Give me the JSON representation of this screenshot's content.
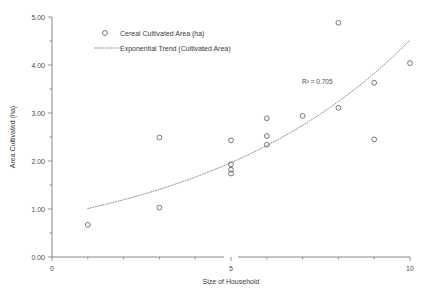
{
  "chart_data": {
    "type": "scatter",
    "title": "",
    "xlabel": "Size of Household",
    "ylabel": "Area Cultivated (ha)",
    "xlim": [
      0,
      10
    ],
    "ylim": [
      0,
      5
    ],
    "grid": false,
    "legend_position": "top-left",
    "x_ticks": [
      0,
      5,
      10
    ],
    "x_tick_labels": [
      "0",
      "5",
      "10"
    ],
    "x_minor_ticks": [
      1,
      2,
      3,
      4,
      6,
      7,
      8,
      9
    ],
    "y_ticks": [
      0,
      1,
      2,
      3,
      4,
      5
    ],
    "y_tick_labels": [
      "0.00",
      "1.00",
      "2.00",
      "3.00",
      "4.00",
      "5.00"
    ],
    "y_minor_ticks": [
      0.5,
      1.5,
      2.5,
      3.5,
      4.5
    ],
    "series": [
      {
        "name": "Cereal Cultivated Area (ha)",
        "marker": "open-circle",
        "points": [
          {
            "x": 1,
            "y": 0.67
          },
          {
            "x": 3,
            "y": 1.03
          },
          {
            "x": 3,
            "y": 2.49
          },
          {
            "x": 5,
            "y": 2.43
          },
          {
            "x": 5,
            "y": 1.93
          },
          {
            "x": 5,
            "y": 1.82
          },
          {
            "x": 5,
            "y": 1.74
          },
          {
            "x": 6,
            "y": 2.89
          },
          {
            "x": 6,
            "y": 2.52
          },
          {
            "x": 6,
            "y": 2.34
          },
          {
            "x": 7,
            "y": 2.94
          },
          {
            "x": 8,
            "y": 4.88
          },
          {
            "x": 8,
            "y": 3.11
          },
          {
            "x": 9,
            "y": 3.63
          },
          {
            "x": 9,
            "y": 2.45
          },
          {
            "x": 10,
            "y": 4.04
          }
        ]
      }
    ],
    "trend": {
      "name": "Exponential Trend (Cultivated Area)",
      "style": "dotted",
      "model": "exponential",
      "x_start": 1.0,
      "x_end": 10.0,
      "y_start": 1.01,
      "y_end": 4.52,
      "r_squared_label": "R² = 0.705",
      "r_squared": 0.705
    }
  },
  "legend": {
    "items": [
      {
        "label": "Cereal Cultivated Area (ha)",
        "marker": "open-circle"
      },
      {
        "label": "Exponential Trend (Cultivated Area)",
        "marker": "dotted-line"
      }
    ]
  },
  "annotation": {
    "r_squared": "R² = 0.705"
  },
  "axes": {
    "x_title": "Size of Household",
    "y_title": "Area Cultivated (ha)"
  },
  "colors": {
    "marker_stroke": "#555555",
    "trend_stroke": "#8a8a8a",
    "axis": "#6b6b6b",
    "text": "#3a3a3a",
    "background": "#ffffff"
  }
}
